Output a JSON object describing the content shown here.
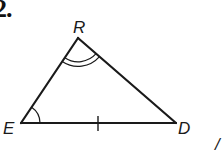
{
  "problem": {
    "number_label": "2."
  },
  "figure": {
    "type": "triangle",
    "vertices": [
      {
        "name": "R",
        "label": "R",
        "x": 78,
        "y": 38
      },
      {
        "name": "E",
        "label": "E",
        "x": 21,
        "y": 123
      },
      {
        "name": "D",
        "label": "D",
        "x": 176,
        "y": 123
      }
    ],
    "sides": [
      {
        "from": "R",
        "to": "E"
      },
      {
        "from": "R",
        "to": "D"
      },
      {
        "from": "E",
        "to": "D",
        "tick_marks": 1
      }
    ],
    "angle_marks": [
      {
        "vertex": "R",
        "arcs": 2
      },
      {
        "vertex": "E",
        "arcs": 1
      }
    ],
    "stroke_color": "#1a1a1a"
  },
  "cutoff_text": {
    "partial_glyph": "/"
  }
}
